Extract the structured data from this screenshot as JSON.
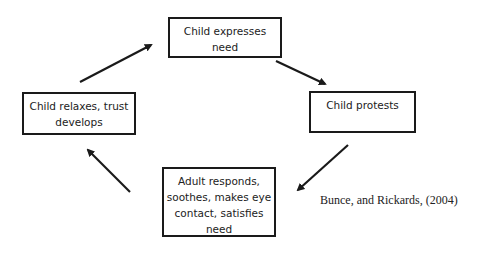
{
  "diagram": {
    "type": "cycle",
    "nodes": [
      {
        "id": "top",
        "lines": [
          "Child expresses",
          "need"
        ]
      },
      {
        "id": "right",
        "lines": [
          "Child protests"
        ]
      },
      {
        "id": "bottom",
        "lines": [
          "Adult responds,",
          "soothes, makes eye",
          "contact, satisfies",
          "need"
        ]
      },
      {
        "id": "left",
        "lines": [
          "Child relaxes, trust",
          "develops"
        ]
      }
    ],
    "edges": [
      {
        "from": "top",
        "to": "right"
      },
      {
        "from": "right",
        "to": "bottom"
      },
      {
        "from": "bottom",
        "to": "left"
      },
      {
        "from": "left",
        "to": "top"
      }
    ],
    "citation": "Bunce, and Rickards, (2004)"
  },
  "colors": {
    "stroke": "#1a1a1a",
    "text": "#222222",
    "background": "#ffffff"
  }
}
